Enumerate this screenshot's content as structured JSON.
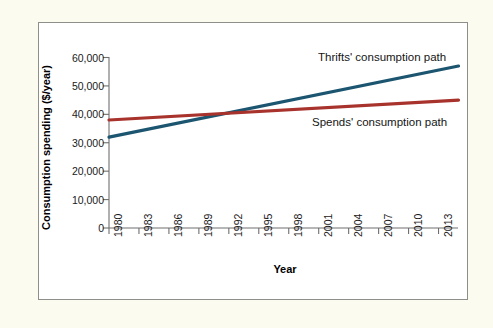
{
  "figure": {
    "background_color": "#fbfbef",
    "panel_color": "#ffffff",
    "border_color": "#8e8e8a"
  },
  "chart_data": {
    "type": "line",
    "title": "",
    "xlabel": "Year",
    "ylabel": "Consumption spending ($/year)",
    "xlim": [
      1980,
      2015
    ],
    "ylim": [
      0,
      62000
    ],
    "grid": false,
    "legend_position": "inline-annotation",
    "x_tick_labels": [
      "1980",
      "1983",
      "1986",
      "1989",
      "1992",
      "1995",
      "1998",
      "2001",
      "2004",
      "2007",
      "2010",
      "2013"
    ],
    "x_ticks": [
      1980,
      1983,
      1986,
      1989,
      1992,
      1995,
      1998,
      2001,
      2004,
      2007,
      2010,
      2013
    ],
    "y_tick_labels": [
      "0",
      "10,000",
      "20,000",
      "30,000",
      "40,000",
      "50,000",
      "60,000"
    ],
    "y_ticks": [
      0,
      10000,
      20000,
      30000,
      40000,
      50000,
      60000
    ],
    "series": [
      {
        "name": "Thrifts' consumption path",
        "color": "#1b5570",
        "annotation": "Thrifts' consumption path",
        "x": [
          1980,
          2015
        ],
        "values": [
          32000,
          57000
        ]
      },
      {
        "name": "Spends' consumption path",
        "color": "#a8322c",
        "annotation": "Spends' consumption path",
        "x": [
          1980,
          2015
        ],
        "values": [
          38000,
          45000
        ]
      }
    ]
  }
}
